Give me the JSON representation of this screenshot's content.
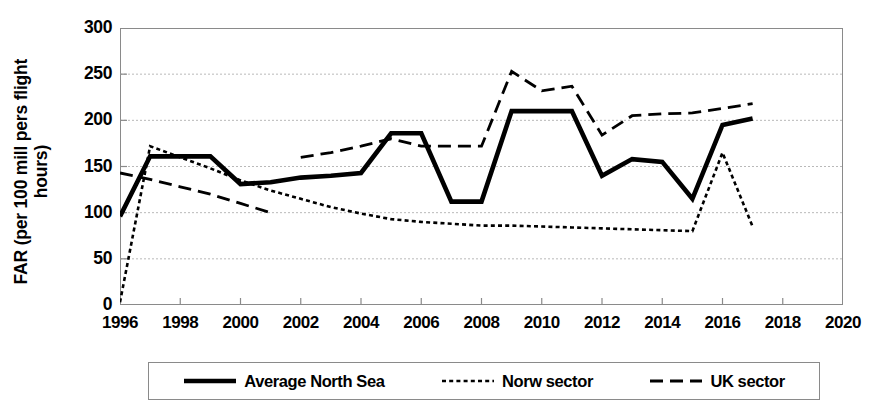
{
  "chart_data": {
    "type": "line",
    "title": "",
    "xlabel": "",
    "ylabel": "FAR (per 100 mill pers flight\nhours)",
    "xlim": [
      1996,
      2020
    ],
    "ylim": [
      0,
      300
    ],
    "ytick_labels": [
      "0",
      "50",
      "100",
      "150",
      "200",
      "250",
      "300"
    ],
    "ytick_values": [
      0,
      50,
      100,
      150,
      200,
      250,
      300
    ],
    "xtick_labels": [
      "1996",
      "1998",
      "2000",
      "2002",
      "2004",
      "2006",
      "2008",
      "2010",
      "2012",
      "2014",
      "2016",
      "2018",
      "2020"
    ],
    "xtick_values": [
      1996,
      1998,
      2000,
      2002,
      2004,
      2006,
      2008,
      2010,
      2012,
      2014,
      2016,
      2018,
      2020
    ],
    "grid": "horizontal-dotted",
    "legend_position": "below-plot",
    "x": [
      1996,
      1997,
      1998,
      1999,
      2000,
      2001,
      2002,
      2003,
      2004,
      2005,
      2006,
      2007,
      2008,
      2009,
      2010,
      2011,
      2012,
      2013,
      2014,
      2015,
      2016,
      2017
    ],
    "series": [
      {
        "name": "Average North Sea",
        "style": "solid-thick",
        "color": "#000000",
        "values": [
          96,
          161,
          161,
          161,
          131,
          133,
          138,
          140,
          143,
          186,
          186,
          112,
          112,
          210,
          210,
          210,
          140,
          158,
          155,
          115,
          195,
          202
        ]
      },
      {
        "name": "Norw sector",
        "style": "dotted",
        "color": "#000000",
        "values": [
          3,
          172,
          160,
          148,
          135,
          124,
          115,
          106,
          99,
          93,
          90,
          88,
          86,
          86,
          85,
          84,
          83,
          82,
          81,
          80,
          165,
          85
        ]
      },
      {
        "name": "UK sector",
        "style": "dashed",
        "color": "#000000",
        "values": [
          143,
          136,
          128,
          120,
          110,
          100,
          160,
          165,
          172,
          180,
          172,
          172,
          172,
          253,
          232,
          237,
          184,
          205,
          207,
          208,
          213,
          218
        ],
        "gap_after_x": 2001
      }
    ]
  },
  "legend": {
    "items": [
      {
        "label": "Average North Sea",
        "swatch": "solid-thick-line-swatch"
      },
      {
        "label": "Norw sector",
        "swatch": "dotted-line-swatch"
      },
      {
        "label": "UK sector",
        "swatch": "dashed-line-swatch"
      }
    ]
  }
}
